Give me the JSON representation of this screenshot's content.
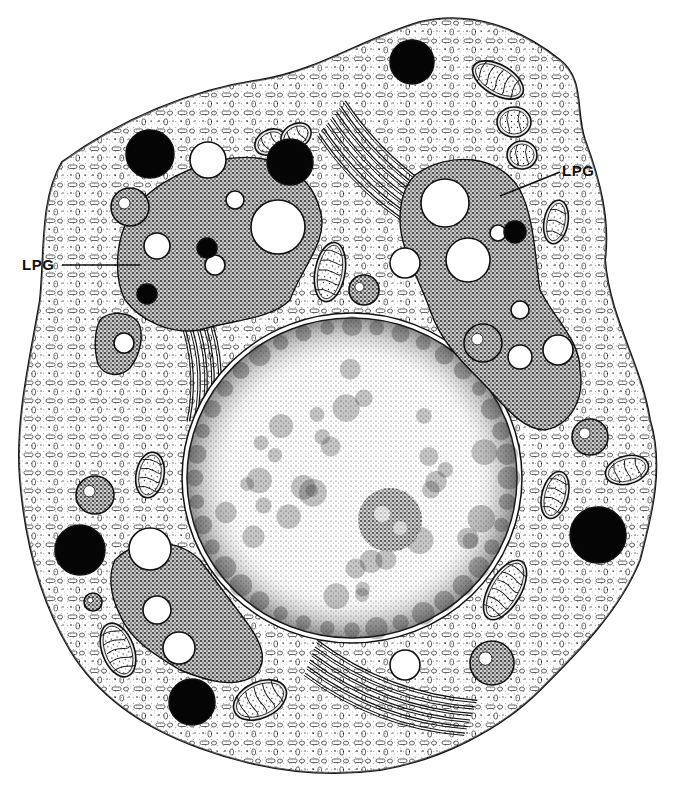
{
  "figure": {
    "type": "cell-illustration",
    "width": 698,
    "height": 789,
    "colors": {
      "ink": "#111111",
      "paper": "#ffffff",
      "cytoplasm": "#f4f4f4",
      "granule_matrix": "#3a3a3a",
      "dense_granule": "#050505",
      "nucleus": "#f7f7f7"
    }
  },
  "cell": {
    "outline": "M 62 162 C 120 120 190 90 260 80 C 320 70 360 40 420 22 C 470 10 520 28 560 60 C 585 80 575 110 585 140 C 600 180 610 220 605 260 C 610 320 640 360 650 420 C 665 470 650 520 640 560 C 620 610 580 650 540 690 C 500 730 440 760 380 770 C 320 778 260 770 200 748 C 150 730 100 700 70 650 C 40 600 25 540 20 480 C 15 420 30 360 40 300 C 45 250 40 200 62 162 Z"
  },
  "nucleus": {
    "cx": 352,
    "cy": 478,
    "rx": 165,
    "ry": 160,
    "nucleolus": {
      "cx": 390,
      "cy": 520,
      "r": 32
    }
  },
  "granule_regions": [
    {
      "name": "upper-left-lpg",
      "path": "M 125 225 C 140 190 180 170 220 160 C 270 150 310 170 320 210 C 330 240 300 270 290 300 C 270 320 230 320 200 330 C 170 335 140 320 125 300 C 115 280 115 250 125 225 Z"
    },
    {
      "name": "right-lpg",
      "path": "M 415 175 C 450 150 500 155 520 190 C 535 220 535 260 540 290 C 555 320 580 340 580 370 C 585 400 570 425 545 430 C 520 430 500 400 480 380 C 460 360 440 340 430 310 C 420 280 400 250 400 220 C 400 200 405 185 415 175 Z"
    },
    {
      "name": "lower-left-lpg",
      "path": "M 115 560 C 140 535 180 540 200 560 C 215 580 230 600 245 620 C 260 640 270 660 255 675 C 235 690 205 680 180 670 C 155 655 130 640 120 615 C 110 595 108 575 115 560 Z"
    },
    {
      "name": "small-left-lpg",
      "path": "M 100 320 C 110 310 130 312 138 322 C 145 335 140 355 130 368 C 120 378 104 376 98 364 C 94 350 94 332 100 320 Z"
    }
  ],
  "vacuoles": [
    {
      "cx": 208,
      "cy": 160,
      "r": 18
    },
    {
      "cx": 278,
      "cy": 227,
      "r": 27
    },
    {
      "cx": 157,
      "cy": 246,
      "r": 13
    },
    {
      "cx": 445,
      "cy": 203,
      "r": 24
    },
    {
      "cx": 468,
      "cy": 260,
      "r": 22
    },
    {
      "cx": 405,
      "cy": 263,
      "r": 15
    },
    {
      "cx": 558,
      "cy": 350,
      "r": 15
    },
    {
      "cx": 520,
      "cy": 357,
      "r": 12
    },
    {
      "cx": 150,
      "cy": 549,
      "r": 21
    },
    {
      "cx": 179,
      "cy": 648,
      "r": 16
    },
    {
      "cx": 157,
      "cy": 610,
      "r": 14
    },
    {
      "cx": 124,
      "cy": 343,
      "r": 10
    },
    {
      "cx": 405,
      "cy": 665,
      "r": 15
    },
    {
      "cx": 215,
      "cy": 265,
      "r": 10
    },
    {
      "cx": 235,
      "cy": 200,
      "r": 9
    },
    {
      "cx": 520,
      "cy": 310,
      "r": 9
    },
    {
      "cx": 498,
      "cy": 233,
      "r": 8
    }
  ],
  "dense_granules": [
    {
      "cx": 150,
      "cy": 154,
      "r": 24
    },
    {
      "cx": 290,
      "cy": 162,
      "r": 23
    },
    {
      "cx": 412,
      "cy": 62,
      "r": 22
    },
    {
      "cx": 80,
      "cy": 550,
      "r": 25
    },
    {
      "cx": 598,
      "cy": 535,
      "r": 28
    },
    {
      "cx": 192,
      "cy": 702,
      "r": 23
    },
    {
      "cx": 147,
      "cy": 294,
      "r": 10
    },
    {
      "cx": 207,
      "cy": 248,
      "r": 10
    },
    {
      "cx": 515,
      "cy": 232,
      "r": 11
    }
  ],
  "mitochondria": [
    {
      "cx": 270,
      "cy": 142,
      "rx": 16,
      "ry": 12,
      "rot": -30
    },
    {
      "cx": 330,
      "cy": 272,
      "rx": 15,
      "ry": 30,
      "rot": 10
    },
    {
      "cx": 498,
      "cy": 80,
      "rx": 28,
      "ry": 15,
      "rot": 30
    },
    {
      "cx": 514,
      "cy": 122,
      "rx": 17,
      "ry": 15,
      "rot": 0
    },
    {
      "cx": 522,
      "cy": 155,
      "rx": 15,
      "ry": 14,
      "rot": 0
    },
    {
      "cx": 556,
      "cy": 222,
      "rx": 12,
      "ry": 22,
      "rot": 10
    },
    {
      "cx": 150,
      "cy": 475,
      "rx": 14,
      "ry": 23,
      "rot": 10
    },
    {
      "cx": 555,
      "cy": 495,
      "rx": 13,
      "ry": 24,
      "rot": 15
    },
    {
      "cx": 627,
      "cy": 470,
      "rx": 22,
      "ry": 14,
      "rot": -15
    },
    {
      "cx": 118,
      "cy": 650,
      "rx": 16,
      "ry": 28,
      "rot": -20
    },
    {
      "cx": 260,
      "cy": 700,
      "rx": 28,
      "ry": 18,
      "rot": -25
    },
    {
      "cx": 505,
      "cy": 590,
      "rx": 16,
      "ry": 33,
      "rot": 30
    },
    {
      "cx": 296,
      "cy": 136,
      "rx": 16,
      "ry": 12,
      "rot": -30
    }
  ],
  "multivesicular_bodies": [
    {
      "cx": 130,
      "cy": 207,
      "r": 19
    },
    {
      "cx": 364,
      "cy": 290,
      "r": 15
    },
    {
      "cx": 483,
      "cy": 343,
      "r": 19
    },
    {
      "cx": 590,
      "cy": 437,
      "r": 18
    },
    {
      "cx": 95,
      "cy": 495,
      "r": 19
    },
    {
      "cx": 492,
      "cy": 663,
      "r": 22
    },
    {
      "cx": 93,
      "cy": 602,
      "r": 9
    }
  ],
  "golgi_stacks": [
    {
      "x1": 330,
      "y1": 120,
      "x2": 480,
      "y2": 240,
      "count": 7,
      "bend": 30
    },
    {
      "x1": 185,
      "y1": 300,
      "x2": 200,
      "y2": 420,
      "count": 5,
      "bend": -20
    },
    {
      "x1": 310,
      "y1": 660,
      "x2": 470,
      "y2": 720,
      "count": 6,
      "bend": 25
    }
  ],
  "labels": [
    {
      "text": "LPG",
      "x": 562,
      "y": 176,
      "line": {
        "x1": 560,
        "y1": 172,
        "x2": 500,
        "y2": 196
      }
    },
    {
      "text": "LPG",
      "x": 22,
      "y": 270,
      "line": {
        "x1": 62,
        "y1": 265,
        "x2": 140,
        "y2": 265
      }
    }
  ]
}
